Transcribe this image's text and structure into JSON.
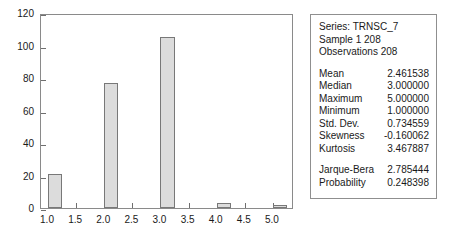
{
  "chart_data": {
    "type": "bar",
    "title": "",
    "subtitle": "",
    "xlabel": "",
    "ylabel": "",
    "categories": [
      "1",
      "2",
      "3",
      "4",
      "5"
    ],
    "values": [
      21,
      77,
      105,
      3,
      2
    ],
    "x": [
      1,
      2,
      3,
      4,
      5
    ],
    "xlim": [
      0.875,
      5.375
    ],
    "ylim": [
      0,
      120
    ],
    "grid": false,
    "legend": null,
    "bar_fill_color": "#dcdcdc",
    "bar_edge_color": "#787878",
    "bar_width": 0.25,
    "bar_align": "left",
    "y_ticks": [
      "0",
      "20",
      "40",
      "60",
      "80",
      "100",
      "120"
    ],
    "y_tick_values": [
      0,
      20,
      40,
      60,
      80,
      100,
      120
    ],
    "x_ticks": [
      "1.0",
      "1.5",
      "2.0",
      "2.5",
      "3.0",
      "3.5",
      "4.0",
      "4.5",
      "5.0"
    ],
    "x_tick_values": [
      1.0,
      1.5,
      2.0,
      2.5,
      3.0,
      3.5,
      4.0,
      4.5,
      5.0
    ],
    "annotations": []
  },
  "stats_panel": {
    "header": [
      "Series: TRNSC_7",
      "Sample 1 208",
      "Observations 208"
    ],
    "rows": [
      {
        "key": "Mean",
        "value": "2.461538"
      },
      {
        "key": "Median",
        "value": "3.000000"
      },
      {
        "key": "Maximum",
        "value": "5.000000"
      },
      {
        "key": "Minimum",
        "value": "1.000000"
      },
      {
        "key": "Std. Dev.",
        "value": "0.734559"
      },
      {
        "key": "Skewness",
        "value": "-0.160062"
      },
      {
        "key": "Kurtosis",
        "value": "3.467887"
      }
    ],
    "test_rows": [
      {
        "key": "Jarque-Bera",
        "value": "2.785444"
      },
      {
        "key": "Probability",
        "value": "0.248398"
      }
    ]
  }
}
